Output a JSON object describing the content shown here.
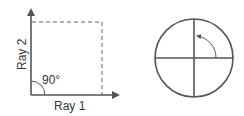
{
  "left_diagram": {
    "ray1_label": "Ray 1",
    "ray2_label": "Ray 2",
    "angle_label": "90°"
  },
  "right_diagram": {
    "description": "circle divided into quadrants with counter-clockwise quarter-turn arrow"
  },
  "colors": {
    "stroke": "#555555",
    "dashed": "#666666",
    "text": "#333333"
  }
}
